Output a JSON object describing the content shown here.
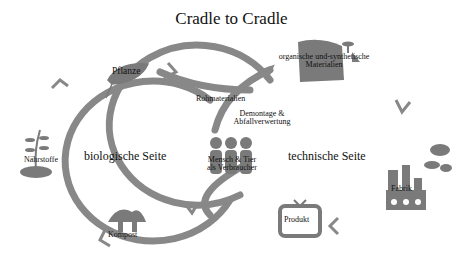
{
  "title": "Cradle to Cradle",
  "cycles": {
    "biological": {
      "label": "biologische Seite"
    },
    "technical": {
      "label": "technische Seite"
    }
  },
  "nodes": {
    "plant": "Pflanze",
    "raw_materials": "Rohmaterialien",
    "nutrients": "Nährstoffe",
    "compost": "Kompost",
    "consumers_line1": "Mensch & Tier",
    "consumers_line2": "als Verbraucher",
    "disassembly_line1": "Demontage &",
    "disassembly_line2": "Abfallverwertung",
    "materials_line1": "organische und-synthetische",
    "materials_line2": "Materialien",
    "factory": "Fabrik",
    "product": "Produkt"
  },
  "colors": {
    "loop": "#888888",
    "icon": "#7a7a7a",
    "text": "#111111",
    "background": "#ffffff"
  }
}
